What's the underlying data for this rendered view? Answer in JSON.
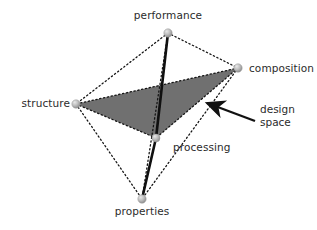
{
  "diagram": {
    "background_color": "#ffffff",
    "face_fill_color": "#707070",
    "edge_color": "#1a1a1a",
    "node_color": "#b0b0b0",
    "text_color": "#2b2b2b",
    "vertices": [
      {
        "id": "performance",
        "label": "performance",
        "x": 168,
        "y": 33,
        "label_x": 168,
        "label_y": 11,
        "label_align": "center"
      },
      {
        "id": "composition",
        "label": "composition",
        "x": 238,
        "y": 68,
        "label_x": 249,
        "label_y": 62,
        "label_align": "left"
      },
      {
        "id": "structure",
        "label": "structure",
        "x": 76,
        "y": 104,
        "label_x": 71,
        "label_y": 98,
        "label_align": "right"
      },
      {
        "id": "processing",
        "label": "processing",
        "x": 156,
        "y": 138,
        "label_x": 172,
        "label_y": 142,
        "label_align": "left"
      },
      {
        "id": "properties",
        "label": "properties",
        "x": 142,
        "y": 199,
        "label_x": 142,
        "label_y": 205,
        "label_align": "center"
      }
    ],
    "dotted_edges": [
      {
        "from": "performance",
        "to": "composition"
      },
      {
        "from": "performance",
        "to": "structure"
      },
      {
        "from": "performance",
        "to": "properties"
      },
      {
        "from": "composition",
        "to": "structure"
      },
      {
        "from": "composition",
        "to": "properties"
      },
      {
        "from": "structure",
        "to": "properties"
      },
      {
        "from": "performance",
        "to": "processing"
      },
      {
        "from": "composition",
        "to": "processing"
      },
      {
        "from": "structure",
        "to": "processing"
      },
      {
        "from": "processing",
        "to": "properties"
      }
    ],
    "solid_edges": [
      {
        "from": "performance",
        "to": "processing"
      },
      {
        "from": "processing",
        "to": "properties"
      }
    ],
    "shaded_face": {
      "name": "design-space-face",
      "vertices": [
        "structure",
        "composition",
        "processing"
      ]
    },
    "annotation": {
      "id": "design-space",
      "line1": "design",
      "line2": "space",
      "text_x": 259,
      "text_y": 104,
      "arrow_tail_x": 255,
      "arrow_tail_y": 121,
      "arrow_head_x": 203,
      "arrow_head_y": 102
    }
  }
}
